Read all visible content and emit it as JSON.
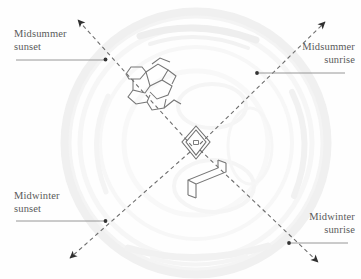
{
  "figure": {
    "background_color": "#fefefe",
    "axis_color": "#6e6e6e",
    "leader_color": "#8d8d8d",
    "label_color": "#5a5a5a",
    "monument_color": "#777777",
    "earthwork_color": "#f1f1f1"
  },
  "labels": {
    "midsummer_sunset": {
      "line1": "Midsummer",
      "line2": "sunset"
    },
    "midsummer_sunrise": {
      "line1": "Midsummer",
      "line2": "sunrise"
    },
    "midwinter_sunset": {
      "line1": "Midwinter",
      "line2": "sunset"
    },
    "midwinter_sunrise": {
      "line1": "Midwinter",
      "line2": "sunrise"
    }
  },
  "icons": {
    "arrowhead": "arrowhead-icon",
    "leader_dot": "leader-dot-icon"
  }
}
